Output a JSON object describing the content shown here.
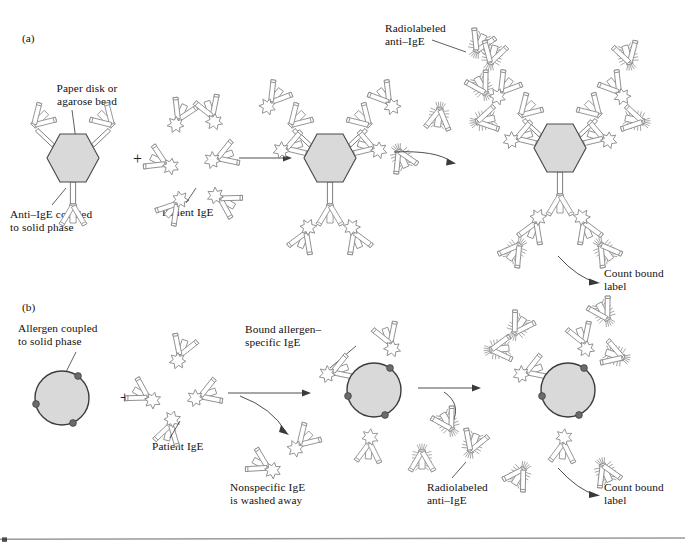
{
  "figure": {
    "kind": "scientific-diagram",
    "background_color": "#ffffff",
    "bead_fill_color": "#d9d9d9",
    "bead_outline_color": "#4a4a4a",
    "antibody_outline_color": "#8b8b8b",
    "text_color": "#111111",
    "rule_color": "#9a9a9a"
  },
  "panels": [
    {
      "tag": "(a)",
      "labels": {
        "solid_phase": "Paper disk or\nagarose bead",
        "capture_antibody": "Anti–IgE coupled\nto solid phase",
        "analyte": "Patient IgE",
        "tracer": "Radiolabeled\nanti–IgE",
        "readout": "Count bound\nlabel"
      },
      "operators": {
        "plus": "+"
      },
      "stages": [
        {
          "name": "solid-phase-with-capture-antibody",
          "bead_shape": "hexagon",
          "antibody_count": 3
        },
        {
          "name": "patient-ige-added",
          "bead_shape": "none",
          "antibody_count": 6
        },
        {
          "name": "patient-ige-captured",
          "bead_shape": "hexagon",
          "antibody_count": 3
        },
        {
          "name": "radiolabeled-anti-ige-added",
          "bead_shape": "none",
          "antibody_count": 4
        },
        {
          "name": "sandwich-complete-labeled",
          "bead_shape": "hexagon",
          "antibody_count": 3
        }
      ]
    },
    {
      "tag": "(b)",
      "labels": {
        "solid_phase": "Allergen coupled\nto solid phase",
        "analyte": "Patient IgE",
        "bound_analyte": "Bound allergen–\nspecific IgE",
        "wash": "Nonspecific IgE\nis washed away",
        "tracer": "Radiolabeled\nanti–IgE",
        "readout": "Count bound\nlabel"
      },
      "operators": {
        "plus": "+"
      },
      "stages": [
        {
          "name": "allergen-coupled-bead",
          "bead_shape": "circle",
          "allergen_sites": 3
        },
        {
          "name": "patient-ige-added",
          "bead_shape": "none",
          "antibody_count": 4
        },
        {
          "name": "allergen-specific-ige-bound",
          "bead_shape": "circle",
          "allergen_sites": 3
        },
        {
          "name": "radiolabeled-anti-ige-added",
          "bead_shape": "none",
          "antibody_count": 3
        },
        {
          "name": "labeled-complex-complete",
          "bead_shape": "circle",
          "allergen_sites": 3
        }
      ]
    }
  ]
}
